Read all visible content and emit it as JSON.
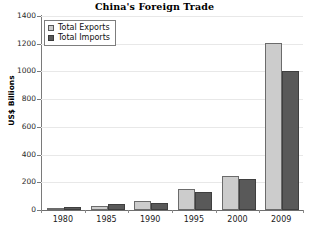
{
  "chart_data": {
    "type": "bar",
    "title": "China's Foreign Trade",
    "xlabel": "",
    "ylabel": "US$ Billions",
    "categories": [
      "1980",
      "1985",
      "1990",
      "1995",
      "2000",
      "2009"
    ],
    "series": [
      {
        "name": "Total Exports",
        "color": "#cccccc",
        "values": [
          18,
          27,
          62,
          149,
          249,
          1202
        ]
      },
      {
        "name": "Total Imports",
        "color": "#595959",
        "values": [
          20,
          42,
          53,
          132,
          225,
          1006
        ]
      }
    ],
    "ylim": [
      0,
      1400
    ],
    "yticks": [
      0,
      200,
      400,
      600,
      800,
      1000,
      1200,
      1400
    ],
    "ytick_labels": [
      "0",
      "200",
      "400",
      "600",
      "800",
      "1000",
      "1200",
      "1400"
    ],
    "grid": true,
    "legend_position": "top-left",
    "legend": [
      "Total Exports",
      "Total Imports"
    ]
  }
}
